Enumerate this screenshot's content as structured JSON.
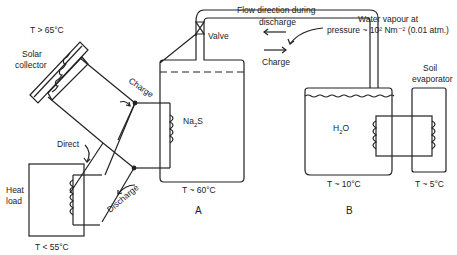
{
  "labels": {
    "solar_temp": "T > 65°C",
    "solar_collector_1": "Solar",
    "solar_collector_2": "collector",
    "heat_load_1": "Heat",
    "heat_load_2": "load",
    "heat_load_temp": "T < 55°C",
    "direct": "Direct",
    "charge_left": "Charge",
    "discharge_left": "Discharge",
    "valve": "Valve",
    "na2s_main": "Na",
    "na2s_sub": "2",
    "na2s_tail": "S",
    "tank_a_temp": "T ~ 60°C",
    "tank_a_label": "A",
    "flow_title_1": "Flow direction during",
    "flow_title_2": "discharge",
    "charge_pipe": "Charge",
    "vapour_1": "Water vapour at",
    "vapour_2": "pressure ~ 10² Nm⁻² (0.01 atm.)",
    "h2o_main": "H",
    "h2o_sub": "2",
    "h2o_tail": "O",
    "tank_b_temp": "T ~ 10°C",
    "tank_b_label": "B",
    "soil_1": "Soil",
    "soil_2": "evaporator",
    "soil_temp": "T ~ 5°C"
  },
  "colors": {
    "line": "#222222",
    "text": "#222222"
  }
}
